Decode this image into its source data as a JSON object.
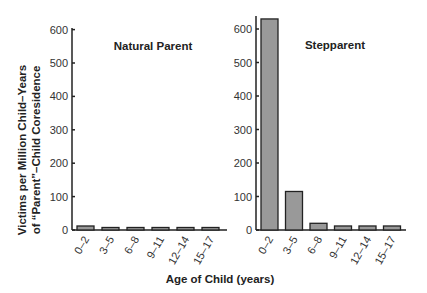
{
  "chart_data": [
    {
      "type": "bar",
      "title": "Natural Parent",
      "categories": [
        "0–2",
        "3–5",
        "6–8",
        "9–11",
        "12–14",
        "15–17"
      ],
      "values": [
        12,
        7,
        6,
        0,
        0,
        0
      ],
      "xlabel": "Age of Child (years)",
      "ylabel": "Victims per Million Child–Years of “Parent”–Child Coresidence",
      "yticks": [
        0,
        100,
        200,
        300,
        400,
        500,
        600
      ],
      "ylim": [
        0,
        620
      ],
      "grid": false,
      "bar_color": "#999999"
    },
    {
      "type": "bar",
      "title": "Stepparent",
      "categories": [
        "0–2",
        "3–5",
        "6–8",
        "9–11",
        "12–14",
        "15–17"
      ],
      "values": [
        630,
        115,
        20,
        12,
        12,
        12
      ],
      "xlabel": "Age of Child (years)",
      "ylabel": "",
      "yticks": [
        0,
        100,
        200,
        300,
        400,
        500,
        600
      ],
      "ylim": [
        0,
        640
      ],
      "grid": false,
      "bar_color": "#999999"
    }
  ],
  "labels": {
    "ylabel_line1": "Victims per Million Child–Years",
    "ylabel_line2": "of “Parent”–Child Coresidence",
    "xlabel": "Age of Child (years)",
    "left_title": "Natural Parent",
    "right_title": "Stepparent"
  }
}
